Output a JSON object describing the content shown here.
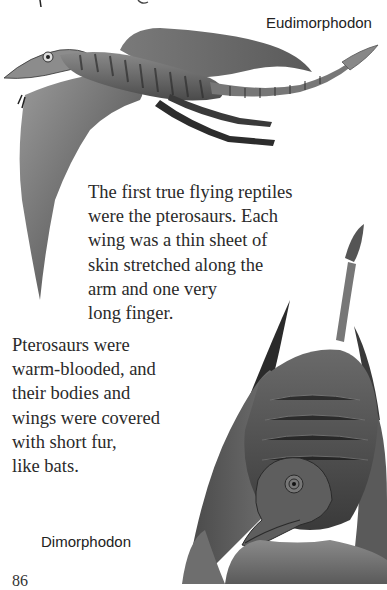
{
  "page": {
    "number": "86",
    "top_fragment": "ng",
    "captions": {
      "top": "Eudimorphodon",
      "bottom": "Dimorphodon"
    },
    "paragraphs": [
      {
        "lines": [
          "The first true flying reptiles",
          "were the pterosaurs.  Each",
          "wing was a thin sheet of",
          "skin stretched along the",
          "arm and one very",
          "long finger."
        ]
      },
      {
        "lines": [
          "Pterosaurs were",
          "warm-blooded, and",
          "their bodies and",
          "wings were covered",
          "with short fur,",
          "like bats."
        ]
      }
    ],
    "illustrations": {
      "top": "eudimorphodon-illustration",
      "bottom": "dimorphodon-illustration"
    }
  }
}
